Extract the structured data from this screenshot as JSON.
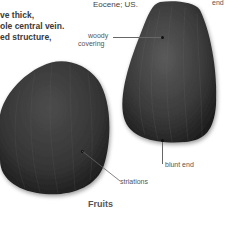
{
  "body_text": {
    "lines": [
      "ve thick,",
      "ole central vein.",
      "ed structure,"
    ]
  },
  "caption": "Eocene; US.",
  "labels": {
    "top_end": "end",
    "woody_covering": [
      "woody",
      "covering"
    ],
    "blunt_end": "blunt end",
    "striations": "striations"
  },
  "section_heading": "Fruits",
  "colors": {
    "specimen_dark": "#2e2e2e",
    "specimen_mid": "#4a4a4a",
    "leader_line": "#666666",
    "background": "#ffffff"
  }
}
